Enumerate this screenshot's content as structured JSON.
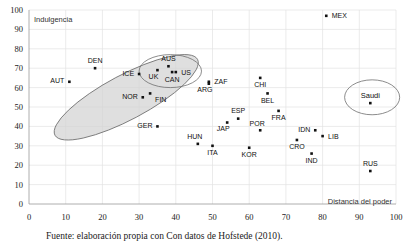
{
  "chart_data": {
    "type": "scatter",
    "title": "",
    "xlabel": "Distancia del poder",
    "ylabel": "Indulgencia",
    "xlim": [
      0,
      100
    ],
    "ylim": [
      0,
      100
    ],
    "xticks": [
      0,
      10,
      20,
      30,
      40,
      50,
      60,
      70,
      80,
      90,
      100
    ],
    "yticks": [
      0,
      10,
      20,
      30,
      40,
      50,
      60,
      70,
      80,
      90,
      100
    ],
    "grid": true,
    "legend": "none",
    "points": [
      {
        "label": "AUT",
        "x": 11,
        "y": 63,
        "label_pos": "left"
      },
      {
        "label": "DEN",
        "x": 18,
        "y": 70,
        "label_pos": "above"
      },
      {
        "label": "ICE",
        "x": 30,
        "y": 67,
        "label_pos": "left"
      },
      {
        "label": "NOR",
        "x": 31,
        "y": 55,
        "label_pos": "left"
      },
      {
        "label": "FIN",
        "x": 33,
        "y": 57,
        "label_pos": "below-right"
      },
      {
        "label": "GER",
        "x": 35,
        "y": 40,
        "label_pos": "left"
      },
      {
        "label": "UK",
        "x": 35,
        "y": 69,
        "label_pos": "below-left"
      },
      {
        "label": "AUS",
        "x": 38,
        "y": 71,
        "label_pos": "above"
      },
      {
        "label": "CAN",
        "x": 39,
        "y": 68,
        "label_pos": "below"
      },
      {
        "label": "US",
        "x": 40,
        "y": 68,
        "label_pos": "right"
      },
      {
        "label": "HUN",
        "x": 46,
        "y": 31,
        "label_pos": "above-left"
      },
      {
        "label": "ITA",
        "x": 50,
        "y": 30,
        "label_pos": "below"
      },
      {
        "label": "ZAF",
        "x": 49,
        "y": 63,
        "label_pos": "right"
      },
      {
        "label": "ARG",
        "x": 49,
        "y": 62,
        "label_pos": "below-left"
      },
      {
        "label": "JAP",
        "x": 54,
        "y": 42,
        "label_pos": "below-left"
      },
      {
        "label": "ESP",
        "x": 57,
        "y": 44,
        "label_pos": "above"
      },
      {
        "label": "KOR",
        "x": 60,
        "y": 29,
        "label_pos": "below"
      },
      {
        "label": "CHI",
        "x": 63,
        "y": 65,
        "label_pos": "below"
      },
      {
        "label": "POR",
        "x": 63,
        "y": 38,
        "label_pos": "above-left"
      },
      {
        "label": "BEL",
        "x": 65,
        "y": 57,
        "label_pos": "below"
      },
      {
        "label": "FRA",
        "x": 68,
        "y": 48,
        "label_pos": "below"
      },
      {
        "label": "CRO",
        "x": 73,
        "y": 33,
        "label_pos": "below"
      },
      {
        "label": "IND",
        "x": 77,
        "y": 26,
        "label_pos": "below"
      },
      {
        "label": "IDN",
        "x": 78,
        "y": 38,
        "label_pos": "left"
      },
      {
        "label": "LIB",
        "x": 80,
        "y": 35,
        "label_pos": "right"
      },
      {
        "label": "MEX",
        "x": 81,
        "y": 97,
        "label_pos": "right"
      },
      {
        "label": "Saudi",
        "x": 93,
        "y": 52,
        "label_pos": "above"
      },
      {
        "label": "RUS",
        "x": 93,
        "y": 17,
        "label_pos": "above"
      }
    ],
    "groupings": [
      {
        "name": "nordic-germanic-cluster",
        "style": "filled-grey",
        "cx": 26.5,
        "cy": 55,
        "rx": 22,
        "ry": 11.5,
        "rotation": -28
      },
      {
        "name": "anglo-cluster",
        "style": "open",
        "cx": 38.5,
        "cy": 68.5,
        "rx": 8.5,
        "ry": 8.5,
        "rotation": 0
      },
      {
        "name": "saudi-cluster",
        "style": "open",
        "cx": 93.5,
        "cy": 55,
        "rx": 7.5,
        "ry": 9,
        "rotation": 0
      }
    ],
    "source_note": "Fuente: elaboración propia con Con datos de Hofstede (2010)."
  }
}
